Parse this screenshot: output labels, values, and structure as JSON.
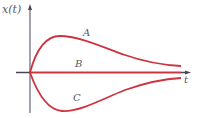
{
  "diagram": {
    "type": "function-graph",
    "axes": {
      "y_label": "x(t)",
      "x_label": "t"
    },
    "curves": [
      {
        "name": "A",
        "label": "A",
        "description": "rises to a peak then decays toward axis from above"
      },
      {
        "name": "B",
        "label": "B",
        "description": "constant zero along t-axis"
      },
      {
        "name": "C",
        "label": "C",
        "description": "falls to a trough then decays toward axis from below"
      }
    ],
    "colors": {
      "curve": "#cc3340",
      "axis": "#4a4458",
      "label": "#555a66"
    }
  }
}
